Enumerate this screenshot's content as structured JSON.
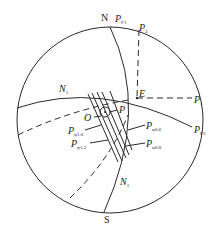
{
  "diagram": {
    "type": "stereographic-projection",
    "colors": {
      "stroke": "#2a2a2a",
      "background": "#ffffff"
    },
    "labels": {
      "north": "N",
      "south": "S",
      "east_point": "E",
      "n1_upper": {
        "main": "N",
        "sub": "1"
      },
      "n1_lower": {
        "main": "N",
        "sub": "1"
      },
      "origin": "O",
      "pf1": {
        "main": "P",
        "sub": "F1"
      },
      "p3": {
        "main": "P",
        "sub": "3"
      },
      "p1": {
        "main": "P",
        "sub": "1"
      },
      "pf3": {
        "main": "P",
        "sub": "F3"
      },
      "p_small": {
        "main": "P",
        "sub": ""
      },
      "p_phi10": {
        "main": "P",
        "sub": "φ1.0"
      },
      "p_phi12": {
        "main": "P",
        "sub": "φ1.2"
      },
      "p_phi06": {
        "main": "P",
        "sub": "φ0.6"
      },
      "p_phi08": {
        "main": "P",
        "sub": "φ0.8"
      }
    }
  }
}
